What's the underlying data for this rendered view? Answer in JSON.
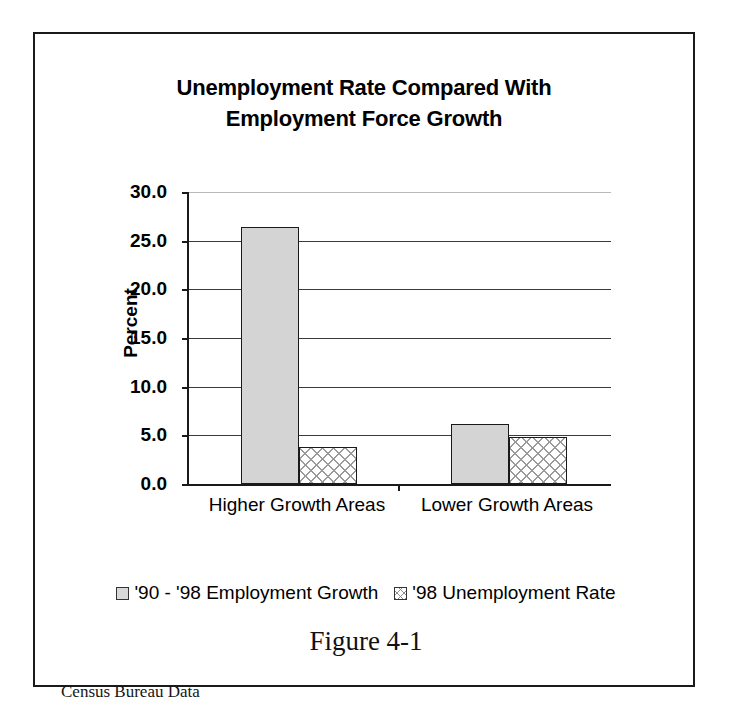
{
  "figure": {
    "caption": "Figure 4-1",
    "source_note": "Census Bureau Data"
  },
  "chart_data": {
    "type": "bar",
    "title": "Unemployment Rate Compared With Employment Force Growth",
    "title_line1": "Unemployment Rate Compared With",
    "title_line2": "Employment Force Growth",
    "xlabel": "",
    "ylabel": "Percent",
    "ylim": [
      0.0,
      30.0
    ],
    "ytick_step": 5.0,
    "ytick_labels": [
      "30.0",
      "25.0",
      "20.0",
      "15.0",
      "10.0",
      "5.0",
      "0.0"
    ],
    "ytick_values": [
      30.0,
      25.0,
      20.0,
      15.0,
      10.0,
      5.0,
      0.0
    ],
    "grid": true,
    "legend_position": "bottom",
    "categories": [
      "Higher Growth Areas",
      "Lower Growth Areas"
    ],
    "series": [
      {
        "name": "'90 - '98 Employment Growth",
        "pattern": "light-gray-fill",
        "values": [
          26.4,
          6.2
        ]
      },
      {
        "name": "'98 Unemployment Rate",
        "pattern": "cross-hatch",
        "values": [
          3.8,
          4.8
        ]
      }
    ]
  },
  "colors": {
    "axis": "#1a1a1a",
    "gridline": "#3a3a3a",
    "series_growth_fill": "#d4d4d4",
    "series_unemp_fill": "#ffffff",
    "text": "#000000",
    "frame_border": "#1a1a1a"
  }
}
